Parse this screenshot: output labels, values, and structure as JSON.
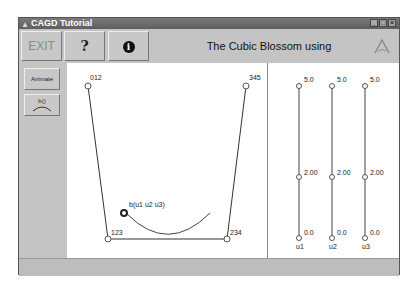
{
  "window": {
    "title": "CAGD Tutorial",
    "controls": [
      "minimize",
      "maximize",
      "close"
    ]
  },
  "toolbar": {
    "exit_label": "EXIT",
    "help_label": "?",
    "info_label": "i",
    "title": "The Cubic Blossom using EvalBlossomProg",
    "logo_icon": "lambda-logo-icon"
  },
  "leftpanel": {
    "animate_label": "Animate",
    "blossom_button_label": "b()"
  },
  "canvas": {
    "control_points": [
      {
        "label": "012",
        "x": 21,
        "y": 23
      },
      {
        "label": "345",
        "x": 179,
        "y": 23
      },
      {
        "label": "123",
        "x": 41,
        "y": 176
      },
      {
        "label": "234",
        "x": 160,
        "y": 176
      }
    ],
    "blossom_point": {
      "label": "b(u1 u2 u3)",
      "x": 57,
      "y": 150
    }
  },
  "sliders": {
    "items": [
      {
        "name": "u1",
        "max": "5.0",
        "value": "2.00",
        "min": "0.0"
      },
      {
        "name": "u2",
        "max": "5.0",
        "value": "2.00",
        "min": "0.0"
      },
      {
        "name": "u3",
        "max": "5.0",
        "value": "2.00",
        "min": "0.0"
      }
    ]
  },
  "colors": {
    "window_bg": "#c4c4c4",
    "titlebar": "#6a6a6a",
    "canvas_bg": "#ffffff",
    "line": "#333333"
  }
}
